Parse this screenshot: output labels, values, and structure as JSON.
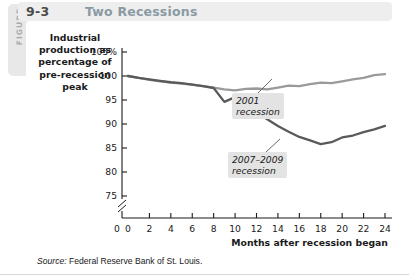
{
  "figure": {
    "rail_label": "FIGURE",
    "number": "9-3",
    "title": "Two Recessions"
  },
  "source": {
    "prefix": "Source:",
    "text": " Federal Reserve Bank of St. Louis."
  },
  "colors": {
    "line_2001": "#9a9a9a",
    "line_2007": "#5a5a5a",
    "axis": "#1a1a1a",
    "callout_bg": "#e3e3e3",
    "header_band": "#eeeeee",
    "rail": "#e8e8e8",
    "title_text": "#8a9aa3"
  },
  "chart_data": {
    "type": "line",
    "title": "Two Recessions",
    "xlabel": "Months after recession began",
    "ylabel": "Industrial production as percentage of pre-recession peak",
    "xlim": [
      0,
      24
    ],
    "ylim": [
      73,
      106
    ],
    "grid": false,
    "axis_break": true,
    "axis_break_label": "0",
    "xticks": [
      0,
      2,
      4,
      6,
      8,
      10,
      12,
      14,
      16,
      18,
      20,
      22,
      24
    ],
    "xtick_labels": [
      "0",
      "2",
      "4",
      "6",
      "8",
      "10",
      "12",
      "14",
      "16",
      "18",
      "20",
      "22",
      "24"
    ],
    "yticks": [
      75,
      80,
      85,
      90,
      95,
      100,
      105
    ],
    "ytick_labels": [
      "75",
      "80",
      "85",
      "90",
      "95",
      "100",
      "105%"
    ],
    "legend_position": "inline-annotations",
    "x": [
      0,
      1,
      2,
      3,
      4,
      5,
      6,
      7,
      8,
      9,
      10,
      11,
      12,
      13,
      14,
      15,
      16,
      17,
      18,
      19,
      20,
      21,
      22,
      23,
      24
    ],
    "series": [
      {
        "name": "2001 recession",
        "color": "#9a9a9a",
        "annotation": "2001\nrecession",
        "values": [
          100.0,
          99.6,
          99.2,
          98.9,
          98.6,
          98.4,
          98.2,
          97.9,
          97.6,
          97.2,
          97.0,
          97.3,
          97.4,
          97.2,
          97.6,
          98.0,
          97.9,
          98.3,
          98.6,
          98.5,
          98.9,
          99.3,
          99.6,
          100.2,
          100.4
        ]
      },
      {
        "name": "2007-2009 recession",
        "color": "#5a5a5a",
        "annotation": "2007–2009\nrecession",
        "values": [
          100.0,
          99.6,
          99.3,
          99.0,
          98.7,
          98.5,
          98.2,
          97.9,
          97.5,
          94.6,
          95.6,
          94.2,
          92.4,
          91.0,
          89.6,
          88.4,
          87.3,
          86.6,
          85.8,
          86.2,
          87.2,
          87.6,
          88.3,
          88.9,
          89.6
        ]
      }
    ]
  }
}
